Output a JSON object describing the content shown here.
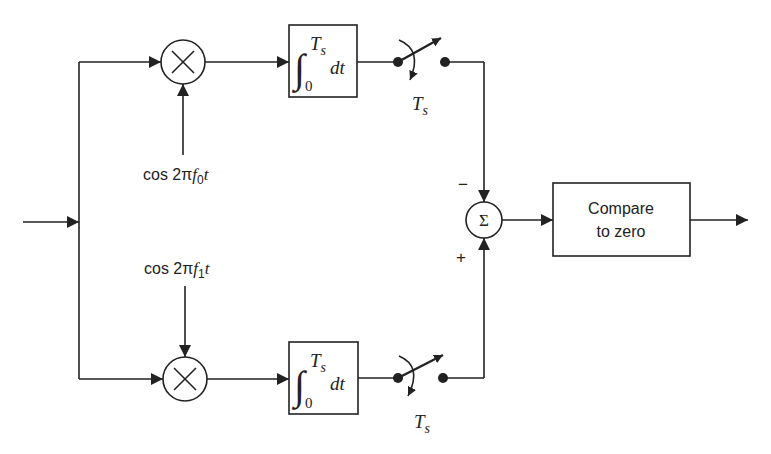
{
  "diagram": {
    "input": {
      "label": ""
    },
    "upper_branch": {
      "multiplier": {
        "symbol": "×",
        "icon": "multiply-icon"
      },
      "reference": {
        "prefix": "cos 2π",
        "f": "f",
        "sub": "0",
        "suffix": "t"
      },
      "integrator": {
        "integral": "∫",
        "upper": "T",
        "upper_sub": "s",
        "lower": "0",
        "dt": "dt"
      },
      "switch": {
        "label": "T",
        "label_sub": "s"
      },
      "sum_sign": "−"
    },
    "lower_branch": {
      "multiplier": {
        "symbol": "×",
        "icon": "multiply-icon"
      },
      "reference": {
        "prefix": "cos 2π",
        "f": "f",
        "sub": "1",
        "suffix": "t"
      },
      "integrator": {
        "integral": "∫",
        "upper": "T",
        "upper_sub": "s",
        "lower": "0",
        "dt": "dt"
      },
      "switch": {
        "label": "T",
        "label_sub": "s"
      },
      "sum_sign": "+"
    },
    "summer": {
      "symbol": "Σ"
    },
    "decision": {
      "line1": "Compare",
      "line2": "to zero"
    },
    "colors": {
      "stroke": "#222222",
      "background": "#ffffff"
    }
  }
}
